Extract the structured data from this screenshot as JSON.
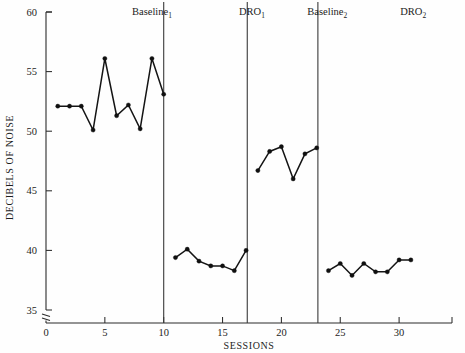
{
  "chart_data": {
    "type": "line",
    "title": "",
    "xlabel": "SESSIONS",
    "ylabel": "DECIBELS OF NOISE",
    "xlim": [
      0,
      34
    ],
    "ylim": [
      35,
      60
    ],
    "grid": false,
    "legend": "none",
    "y_ticks": [
      35,
      40,
      45,
      50,
      55,
      60
    ],
    "y_tick_labels": [
      "35",
      "40",
      "45",
      "50",
      "55",
      "60"
    ],
    "x_ticks": [
      0,
      5,
      10,
      15,
      20,
      25,
      30
    ],
    "x_tick_labels": [
      "0",
      "5",
      "10",
      "15",
      "20",
      "25",
      "30"
    ],
    "axis_break_y": true,
    "phases": [
      {
        "name": "Baseline",
        "subscript": "1",
        "label_x": 9.0,
        "x_start": 0.0,
        "x_end": 10.0,
        "x": [
          1,
          2,
          3,
          4,
          5,
          6,
          7,
          8,
          9,
          10
        ],
        "y": [
          52.1,
          52.1,
          52.1,
          50.1,
          56.1,
          51.3,
          52.2,
          50.2,
          56.1,
          53.1
        ]
      },
      {
        "name": "DRO",
        "subscript": "1",
        "label_x": 17.5,
        "x_start": 10.0,
        "x_end": 17.1,
        "x": [
          11,
          12,
          13,
          14,
          15,
          16,
          17
        ],
        "y": [
          39.4,
          40.1,
          39.1,
          38.7,
          38.7,
          38.3,
          40.0
        ]
      },
      {
        "name": "Baseline",
        "subscript": "2",
        "label_x": 23.9,
        "x_start": 17.1,
        "x_end": 23.1,
        "x": [
          18,
          19,
          20,
          21,
          22,
          23
        ],
        "y": [
          46.7,
          48.3,
          48.7,
          46.0,
          48.1,
          48.6
        ]
      },
      {
        "name": "DRO",
        "subscript": "2",
        "label_x": 31.2,
        "x_start": 23.1,
        "x_end": 31.0,
        "x": [
          24,
          25,
          26,
          27,
          28,
          29,
          30,
          31
        ],
        "y": [
          38.3,
          38.9,
          37.9,
          38.9,
          38.2,
          38.2,
          39.2,
          39.2
        ]
      }
    ],
    "phase_dividers": [
      10.0,
      17.1,
      23.1
    ],
    "colors": {
      "line": "#141414",
      "marker": "#101010",
      "axis": "#2b2b2b",
      "divider": "#3a3a3a",
      "background": "#fefefe"
    }
  }
}
